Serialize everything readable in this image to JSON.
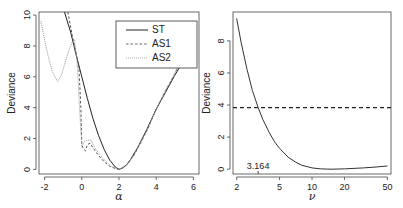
{
  "chart_data": [
    {
      "type": "line",
      "xlabel": "α",
      "ylabel": "Deviance",
      "xlim": [
        -2.3,
        6.3
      ],
      "ylim": [
        -0.3,
        10.2
      ],
      "xticks": [
        -2,
        0,
        2,
        4,
        6
      ],
      "xtick_labels": [
        "-2",
        "0",
        "2",
        "4",
        "6"
      ],
      "yticks": [
        0,
        2,
        4,
        6,
        8,
        10
      ],
      "ytick_labels": [
        "0",
        "2",
        "4",
        "6",
        "8",
        "10"
      ],
      "grid": false,
      "legend": {
        "placement": "top-right",
        "entries": [
          "ST",
          "AS1",
          "AS2"
        ]
      },
      "series": [
        {
          "name": "ST",
          "style": "solid",
          "color": "#222222",
          "x": [
            -0.93,
            -0.6,
            -0.3,
            0,
            0.3,
            0.6,
            0.9,
            1.2,
            1.5,
            1.8,
            2.0,
            2.2,
            2.5,
            3.0,
            3.5,
            4.0,
            4.5,
            5.0,
            5.5,
            5.8
          ],
          "y": [
            10.2,
            8.9,
            7.4,
            6.0,
            4.6,
            3.3,
            2.2,
            1.3,
            0.6,
            0.15,
            0.0,
            0.1,
            0.4,
            1.4,
            2.6,
            3.9,
            5.0,
            6.1,
            7.1,
            7.7
          ]
        },
        {
          "name": "AS1",
          "style": "dashed",
          "color": "#555555",
          "x": [
            -0.75,
            -0.5,
            -0.3,
            -0.15,
            -0.05,
            0.0,
            0.1,
            0.2,
            0.3,
            0.45,
            0.6,
            0.9,
            1.2,
            1.5,
            1.8,
            2.0,
            2.3,
            2.8,
            3.5,
            4.0,
            4.5,
            5.0,
            5.5,
            5.8
          ],
          "y": [
            10.2,
            8.6,
            7.5,
            6.5,
            4.0,
            1.6,
            1.3,
            1.2,
            1.6,
            1.7,
            1.4,
            0.9,
            0.5,
            0.2,
            0.05,
            0.0,
            0.15,
            0.9,
            2.5,
            3.9,
            5.1,
            6.2,
            7.6,
            8.4
          ]
        },
        {
          "name": "AS2",
          "style": "dotted",
          "color": "#999999",
          "x": [
            -2.2,
            -2.0,
            -1.8,
            -1.6,
            -1.4,
            -1.3,
            -1.1,
            -0.9,
            -0.7,
            -0.5,
            -0.4,
            -0.25,
            -0.1,
            0.0,
            0.15,
            0.3,
            0.5,
            0.7,
            1.0,
            1.3,
            1.6,
            1.9,
            2.0,
            2.3,
            2.8,
            3.5,
            4.0,
            4.5,
            5.0,
            5.5,
            5.8
          ],
          "y": [
            9.6,
            8.4,
            7.3,
            6.4,
            5.9,
            5.7,
            6.1,
            6.9,
            7.7,
            8.3,
            8.4,
            7.0,
            3.5,
            1.5,
            1.8,
            1.9,
            1.9,
            1.4,
            0.9,
            0.5,
            0.2,
            0.05,
            0.0,
            0.15,
            0.9,
            2.5,
            3.9,
            5.1,
            6.2,
            7.6,
            8.4
          ]
        }
      ]
    },
    {
      "type": "line",
      "xlabel": "ν",
      "ylabel": "Deviance",
      "xscale": "log",
      "xlim": [
        1.85,
        54
      ],
      "ylim": [
        -0.3,
        9.8
      ],
      "xticks": [
        2,
        5,
        10,
        20,
        50
      ],
      "xtick_labels": [
        "2",
        "5",
        "10",
        "20",
        "50"
      ],
      "yticks": [
        0,
        2,
        4,
        6,
        8
      ],
      "ytick_labels": [
        "0",
        "2",
        "4",
        "6",
        "8"
      ],
      "grid": false,
      "annotations": [
        {
          "text": "3.164",
          "x": 3.164
        }
      ],
      "hline": {
        "y": 3.84,
        "style": "dashed"
      },
      "series": [
        {
          "name": "deviance",
          "style": "solid",
          "color": "#333333",
          "x": [
            2,
            2.2,
            2.5,
            2.8,
            3.164,
            3.5,
            4,
            4.5,
            5,
            6,
            7,
            8,
            10,
            12,
            15,
            20,
            30,
            40,
            50
          ],
          "y": [
            9.4,
            7.9,
            6.2,
            4.9,
            3.84,
            3.1,
            2.3,
            1.7,
            1.3,
            0.75,
            0.45,
            0.25,
            0.08,
            0.02,
            0.0,
            0.02,
            0.08,
            0.14,
            0.2
          ]
        }
      ]
    }
  ]
}
